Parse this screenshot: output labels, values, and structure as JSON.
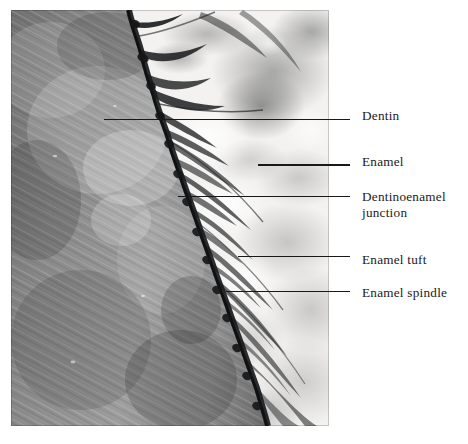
{
  "figure": {
    "kind": "light-microscope-histology-photomicrograph",
    "background_color": "#ffffff",
    "ink_color": "#1a1a1a",
    "photo": {
      "x": 11,
      "y": 10,
      "width": 318,
      "height": 416,
      "tone": "grayscale",
      "regions": [
        {
          "name": "dentin",
          "description": "dark grey field with fine diagonal striations (dentinal tubules) running upper-left to lower-right",
          "side": "left"
        },
        {
          "name": "enamel",
          "description": "bright white field with mottled grey texture",
          "side": "right"
        },
        {
          "name": "dentinoenamel-junction",
          "description": "dark jagged scalloped border separating dentin from enamel",
          "side": "center"
        }
      ]
    }
  },
  "annotations": [
    {
      "id": "dentin",
      "label": "Dentin",
      "label_x": 362,
      "label_y": 108,
      "leader": {
        "x": 104,
        "y": 119,
        "length": 246,
        "weight": "thin"
      }
    },
    {
      "id": "enamel",
      "label": "Enamel",
      "label_x": 362,
      "label_y": 154,
      "leader": {
        "x": 258,
        "y": 164,
        "length": 92,
        "weight": "thick"
      }
    },
    {
      "id": "dentinoenamel-junction",
      "label": "Dentinoenamel\njunction",
      "label_x": 362,
      "label_y": 189,
      "leader": {
        "x": 178,
        "y": 196,
        "length": 172,
        "weight": "thin"
      }
    },
    {
      "id": "enamel-tuft",
      "label": "Enamel tuft",
      "label_x": 362,
      "label_y": 252,
      "leader": {
        "x": 238,
        "y": 256,
        "length": 112,
        "weight": "thin"
      }
    },
    {
      "id": "enamel-spindle",
      "label": "Enamel spindle",
      "label_x": 362,
      "label_y": 285,
      "leader": {
        "x": 226,
        "y": 291,
        "length": 124,
        "weight": "thin"
      }
    }
  ]
}
